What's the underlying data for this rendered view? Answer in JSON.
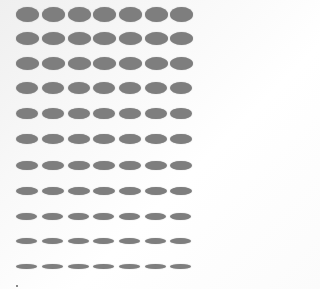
{
  "figure": {
    "columns": 7,
    "rows": 11,
    "fill_color": "#7e7e7e",
    "background_color": "#ffffff",
    "column_left_x": [
      16,
      42,
      68,
      93,
      119,
      145,
      170
    ],
    "row_center_y": [
      14,
      38,
      63,
      88,
      113,
      139,
      165,
      191,
      216,
      241,
      266
    ],
    "ellipse_width": [
      23,
      23,
      23,
      22,
      22,
      22,
      22,
      22,
      21,
      21,
      21
    ],
    "ellipse_height": [
      15,
      13,
      13,
      12,
      11,
      10,
      9,
      8,
      7,
      6,
      5
    ]
  },
  "speck": {
    "x": 16,
    "y": 285
  }
}
